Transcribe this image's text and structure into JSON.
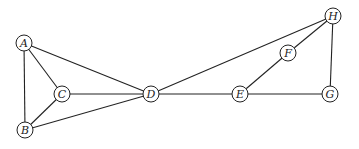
{
  "graph": {
    "nodes": [
      {
        "id": "A",
        "label": "A",
        "x": 24,
        "y": 43
      },
      {
        "id": "B",
        "label": "B",
        "x": 25,
        "y": 130
      },
      {
        "id": "C",
        "label": "C",
        "x": 62,
        "y": 94
      },
      {
        "id": "D",
        "label": "D",
        "x": 151,
        "y": 94
      },
      {
        "id": "E",
        "label": "E",
        "x": 240,
        "y": 94
      },
      {
        "id": "F",
        "label": "F",
        "x": 288,
        "y": 53
      },
      {
        "id": "G",
        "label": "G",
        "x": 330,
        "y": 94
      },
      {
        "id": "H",
        "label": "H",
        "x": 333,
        "y": 16
      }
    ],
    "edges": [
      [
        "A",
        "B"
      ],
      [
        "A",
        "C"
      ],
      [
        "A",
        "D"
      ],
      [
        "B",
        "C"
      ],
      [
        "B",
        "D"
      ],
      [
        "C",
        "D"
      ],
      [
        "D",
        "E"
      ],
      [
        "D",
        "H"
      ],
      [
        "E",
        "F"
      ],
      [
        "F",
        "H"
      ],
      [
        "E",
        "G"
      ],
      [
        "G",
        "H"
      ]
    ],
    "node_radius": 8
  }
}
